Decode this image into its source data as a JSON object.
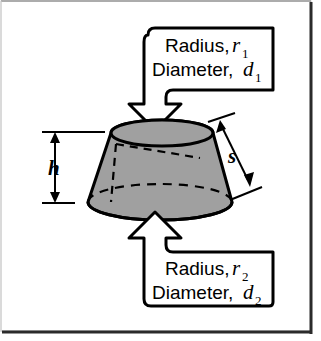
{
  "figure": {
    "name": "frustum-of-a-cone-diagram",
    "background_color": "#ffffff",
    "border_color": "#2b2b2b",
    "solid_fill_color": "#a0a0a0",
    "line_color": "#000000"
  },
  "callouts": {
    "top": {
      "name": "top-callout",
      "line1_label": "Radius,",
      "line1_variable": "r",
      "line1_subscript": "1",
      "line2_label": "Diameter,",
      "line2_variable": "d",
      "line2_subscript": "1",
      "arrow_direction": "down",
      "points_to": "top-face"
    },
    "bottom": {
      "name": "bottom-callout",
      "line1_label": "Radius,",
      "line1_variable": "r",
      "line1_subscript": "2",
      "line2_label": "Diameter,",
      "line2_variable": "d",
      "line2_subscript": "2",
      "arrow_direction": "up",
      "points_to": "bottom-face"
    }
  },
  "dimensions": {
    "height": {
      "name": "height-dimension",
      "symbol": "h",
      "description": "vertical height of frustum",
      "position": "left",
      "arrow_style": "double-headed"
    },
    "slant": {
      "name": "slant-height-dimension",
      "symbol": "s",
      "description": "slant height along lateral side",
      "position": "right",
      "arrow_style": "double-headed"
    }
  },
  "shape": {
    "name": "frustum",
    "type": "frustum-of-a-cone",
    "top_face": "ellipse",
    "bottom_face": "ellipse",
    "hidden_edges": "dashed"
  }
}
